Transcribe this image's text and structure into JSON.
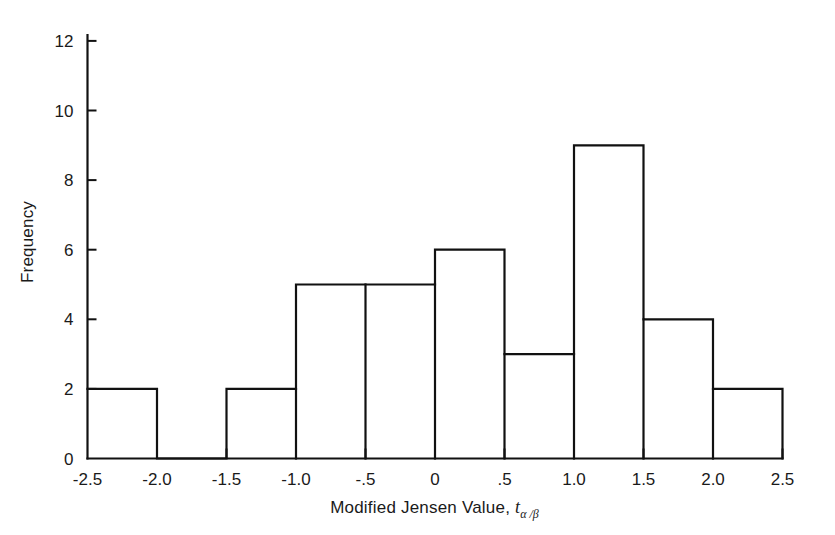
{
  "chart_data": {
    "type": "bar",
    "subtype": "histogram",
    "title": "",
    "xlabel": "Modified Jensen Value, t",
    "xlabel_italic_symbol": "t",
    "xlabel_subscript": "α /β",
    "ylabel": "Frequency",
    "bin_width": 0.5,
    "bin_edges": [
      -2.5,
      -2.0,
      -1.5,
      -1.0,
      -0.5,
      0,
      0.5,
      1.0,
      1.5,
      2.0,
      2.5
    ],
    "categories": [
      "-2.5 to -2.0",
      "-2.0 to -1.5",
      "-1.5 to -1.0",
      "-1.0 to -0.5",
      "-0.5 to 0",
      "0 to .5",
      ".5 to 1.0",
      "1.0 to 1.5",
      "1.5 to 2.0",
      "2.0 to 2.5"
    ],
    "values": [
      2,
      0,
      2,
      5,
      5,
      6,
      3,
      9,
      4,
      2
    ],
    "total_frequency": 38,
    "xlim": [
      -2.5,
      2.5
    ],
    "ylim": [
      0,
      12.4
    ],
    "xticks": [
      -2.5,
      -2.0,
      -1.5,
      -1.0,
      -0.5,
      0,
      0.5,
      1.0,
      1.5,
      2.0,
      2.5
    ],
    "xtick_labels": [
      "-2.5",
      "-2.0",
      "-1.5",
      "-1.0",
      "-.5",
      "0",
      ".5",
      "1.0",
      "1.5",
      "2.0",
      "2.5"
    ],
    "yticks": [
      0,
      2,
      4,
      6,
      8,
      10,
      12
    ],
    "ytick_labels": [
      "0",
      "2",
      "4",
      "6",
      "8",
      "10",
      "12"
    ],
    "grid": false,
    "legend": false,
    "bar_color": "none",
    "line_color": "#111111",
    "background": "#ffffff"
  }
}
